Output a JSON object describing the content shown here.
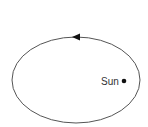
{
  "diagram": {
    "orbit": {
      "cx": 76,
      "cy": 80,
      "rx": 64,
      "ry": 43,
      "stroke": "#555555",
      "direction": "counterclockwise"
    },
    "arrow": {
      "x": 75,
      "y": 37,
      "pointing": "left"
    },
    "sun": {
      "label": "Sun",
      "x": 124,
      "y": 81,
      "color": "#111111"
    }
  }
}
